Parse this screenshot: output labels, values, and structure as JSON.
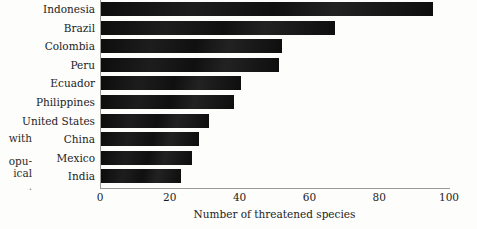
{
  "margin_text": {
    "lines": [
      "with",
      "opu-",
      "ical",
      "."
    ]
  },
  "chart_data": {
    "type": "bar",
    "orientation": "horizontal",
    "title": "",
    "xlabel": "Number of threatened species",
    "ylabel": "",
    "categories": [
      "Indonesia",
      "Brazil",
      "Colombia",
      "Peru",
      "Ecuador",
      "Philippines",
      "United States",
      "China",
      "Mexico",
      "India"
    ],
    "values": [
      95,
      67,
      52,
      51,
      40,
      38,
      31,
      28,
      26,
      23
    ],
    "xlim": [
      0,
      100
    ],
    "xticks": [
      0,
      20,
      40,
      60,
      80,
      100
    ],
    "xticklabels": [
      "0",
      "20",
      "40",
      "60",
      "80",
      "100"
    ],
    "grid": false,
    "legend": "none",
    "bar_color": "#141414",
    "axis_color": "#9a9a96",
    "background": "#fdfdfc"
  }
}
